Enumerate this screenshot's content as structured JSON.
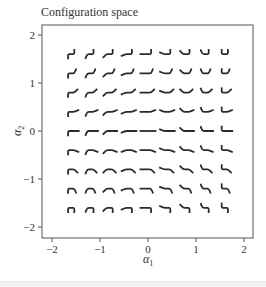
{
  "title": "Configuration space",
  "chart_data": {
    "type": "scatter",
    "title": "Configuration space",
    "xlabel": "α1",
    "ylabel": "α2",
    "xlim": [
      -2.2,
      2.2
    ],
    "ylim": [
      -2.2,
      2.2
    ],
    "xticks": [
      -2,
      -1,
      0,
      1,
      2
    ],
    "yticks": [
      -2,
      -1,
      0,
      1,
      2
    ],
    "grid": false,
    "legend": null,
    "marker": "three-link swimmer glyph: left link angle = α1, right link angle = α2",
    "x": [
      -1.6,
      -1.2,
      -0.8,
      -0.4,
      0,
      0.4,
      0.8,
      1.2,
      1.6
    ],
    "y": [
      1.6,
      1.2,
      0.8,
      0.4,
      0,
      -0.4,
      -0.8,
      -1.2,
      -1.6
    ],
    "points_description": "9×9 grid of glyphs at every (α1, α2) combination of the x and y values"
  },
  "axes": {
    "x_tick_labels": [
      "−2",
      "−1",
      "0",
      "1",
      "2"
    ],
    "y_tick_labels": [
      "2",
      "1",
      "0",
      "−1",
      "−2"
    ],
    "xlabel_main": "α",
    "xlabel_sub": "1",
    "ylabel_main": "α",
    "ylabel_sub": "2"
  },
  "colors": {
    "glyph": "#2b2b2b",
    "axis": "#555555",
    "text": "#333333"
  }
}
